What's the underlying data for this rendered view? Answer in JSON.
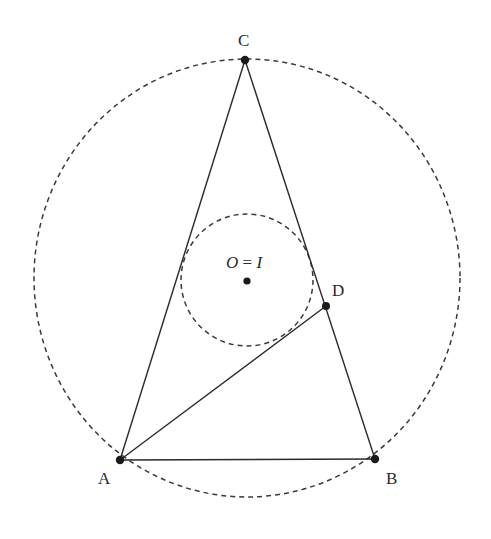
{
  "figure": {
    "points": {
      "A": {
        "label": "A",
        "x": 120,
        "y": 460,
        "label_x": 98,
        "label_y": 484
      },
      "B": {
        "label": "B",
        "x": 375,
        "y": 459,
        "label_x": 386,
        "label_y": 484
      },
      "C": {
        "label": "C",
        "x": 245,
        "y": 60,
        "label_x": 238,
        "label_y": 46
      },
      "D": {
        "label": "D",
        "x": 326,
        "y": 306,
        "label_x": 332,
        "label_y": 296
      },
      "center": {
        "label": "O = I",
        "x": 247,
        "y": 281,
        "label_x": 225,
        "label_y": 268
      }
    },
    "center_label": {
      "left": "O",
      "eq": " = ",
      "right": "I"
    },
    "circumcircle": {
      "cx": 247,
      "cy": 278,
      "rx": 213,
      "ry": 219,
      "style": "dashed"
    },
    "incircle": {
      "cx": 247,
      "cy": 280,
      "r": 66,
      "style": "dashed"
    },
    "segments": [
      {
        "from": "A",
        "to": "B"
      },
      {
        "from": "B",
        "to": "C"
      },
      {
        "from": "C",
        "to": "A"
      },
      {
        "from": "A",
        "to": "D"
      }
    ]
  }
}
